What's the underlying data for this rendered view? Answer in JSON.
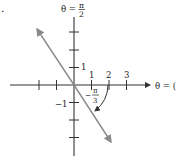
{
  "figure": {
    "part_label": ".",
    "vertical_axis_label": {
      "lhs": "θ =",
      "numerator": "π",
      "denominator": "2"
    },
    "horizontal_axis_label": "θ = (",
    "x_tick_labels": [
      "1",
      "2",
      "3"
    ],
    "y_tick_labels": [
      "1",
      "−1"
    ],
    "angle_label": {
      "sign": "−",
      "numerator": "π",
      "denominator": "3"
    },
    "colors": {
      "axis": "#333333",
      "line": "#8a8a8a",
      "arc": "#333333",
      "text": "#222222"
    }
  }
}
